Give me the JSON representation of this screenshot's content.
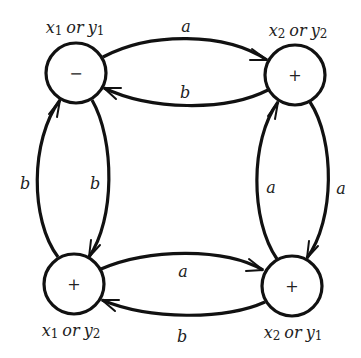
{
  "diagram": {
    "type": "state-transition-graph",
    "nodes": [
      {
        "id": "top-left",
        "sign": "−",
        "label_var1": "x",
        "label_sub1": "1",
        "label_or": "or",
        "label_var2": "y",
        "label_sub2": "1"
      },
      {
        "id": "top-right",
        "sign": "+",
        "label_var1": "x",
        "label_sub1": "2",
        "label_or": "or",
        "label_var2": "y",
        "label_sub2": "2"
      },
      {
        "id": "bottom-left",
        "sign": "+",
        "label_var1": "x",
        "label_sub1": "1",
        "label_or": "or",
        "label_var2": "y",
        "label_sub2": "2"
      },
      {
        "id": "bottom-right",
        "sign": "+",
        "label_var1": "x",
        "label_sub1": "2",
        "label_or": "or",
        "label_var2": "y",
        "label_sub2": "1"
      }
    ],
    "edges": [
      {
        "from": "top-left",
        "to": "top-right",
        "label": "a"
      },
      {
        "from": "top-right",
        "to": "top-left",
        "label": "b"
      },
      {
        "from": "bottom-left",
        "to": "top-left",
        "label": "b"
      },
      {
        "from": "top-left",
        "to": "bottom-left",
        "label": "b"
      },
      {
        "from": "bottom-right",
        "to": "top-right",
        "label": "a"
      },
      {
        "from": "top-right",
        "to": "bottom-right",
        "label": "a"
      },
      {
        "from": "bottom-left",
        "to": "bottom-right",
        "label": "a"
      },
      {
        "from": "bottom-right",
        "to": "bottom-left",
        "label": "b"
      }
    ]
  }
}
